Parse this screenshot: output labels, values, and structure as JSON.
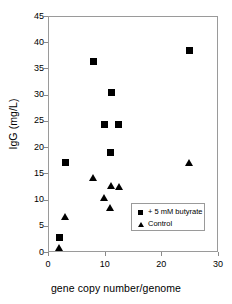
{
  "chart_data": {
    "type": "scatter",
    "title": "",
    "xlabel": "gene copy number/genome",
    "ylabel": "IgG (mg/L)",
    "xlim": [
      0,
      30
    ],
    "ylim": [
      0,
      45
    ],
    "xticks": [
      0,
      10,
      20,
      30
    ],
    "yticks": [
      0,
      5,
      10,
      15,
      20,
      25,
      30,
      35,
      40,
      45
    ],
    "grid": false,
    "legend_position": "inside-bottom-right",
    "series": [
      {
        "name": "+ 5 mM butyrate",
        "marker": "square",
        "color": "#000000",
        "points": [
          {
            "x": 2.0,
            "y": 2.7
          },
          {
            "x": 3.0,
            "y": 17.1
          },
          {
            "x": 8.0,
            "y": 36.4
          },
          {
            "x": 10.0,
            "y": 24.4
          },
          {
            "x": 11.0,
            "y": 18.9
          },
          {
            "x": 11.2,
            "y": 30.4
          },
          {
            "x": 12.5,
            "y": 24.4
          },
          {
            "x": 25.0,
            "y": 38.5
          }
        ]
      },
      {
        "name": "Control",
        "marker": "triangle",
        "color": "#000000",
        "points": [
          {
            "x": 2.0,
            "y": 0.7
          },
          {
            "x": 3.0,
            "y": 6.6
          },
          {
            "x": 8.0,
            "y": 14.0
          },
          {
            "x": 10.0,
            "y": 10.3
          },
          {
            "x": 11.0,
            "y": 8.4
          },
          {
            "x": 11.2,
            "y": 12.6
          },
          {
            "x": 12.5,
            "y": 12.3
          },
          {
            "x": 25.0,
            "y": 16.9
          }
        ]
      }
    ]
  },
  "legend": {
    "entries": [
      {
        "label": "+ 5 mM butyrate",
        "marker": "square"
      },
      {
        "label": "Control",
        "marker": "triangle"
      }
    ]
  }
}
